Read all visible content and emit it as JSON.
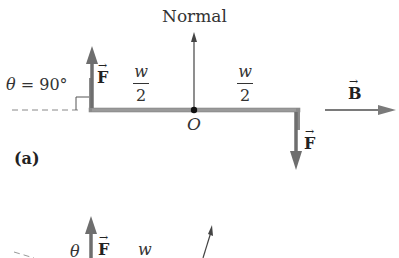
{
  "diagram": {
    "panel_a": {
      "normal_label": "Normal",
      "theta_label": "θ",
      "theta_eq": " = 90°",
      "force_label": "F",
      "vector_arrow": "→",
      "field_label": "B",
      "half_width_num": "w",
      "half_width_den": "2",
      "origin_label": "O",
      "panel_label": "(a)"
    },
    "panel_b": {
      "theta_label": "θ",
      "force_label": "F",
      "width_label": "w"
    },
    "colors": {
      "bar": "#8a8a8a",
      "force_arrow": "#6e6e6e",
      "field_arrow": "#7a7a7a",
      "normal_arrow": "#444444",
      "text": "#222222"
    }
  }
}
